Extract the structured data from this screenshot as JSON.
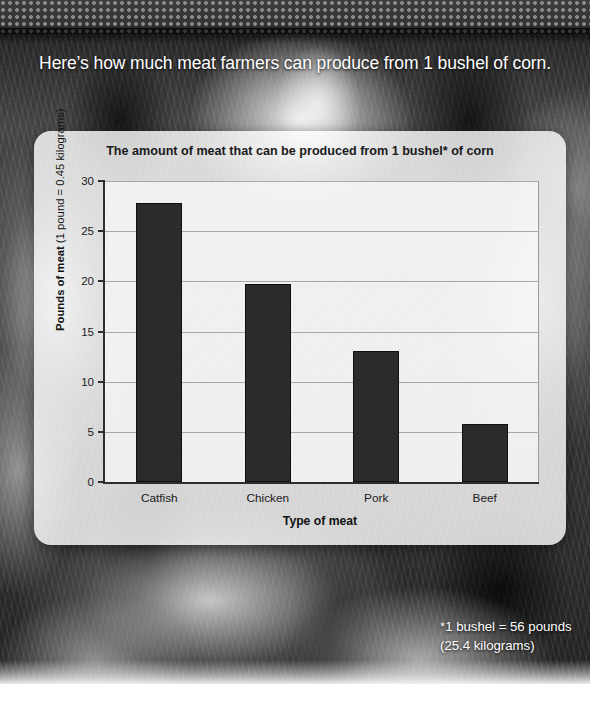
{
  "headline": "Here’s how much meat farmers can produce from 1 bushel of corn.",
  "footnote": {
    "line1": "*1 bushel = 56 pounds",
    "line2": "(25.4 kilograms)"
  },
  "axis": {
    "y_title_bold": "Pounds of meat ",
    "y_title_regular": "(1 pound = 0.45 kilograms)",
    "x_title": "Type of meat"
  },
  "colors": {
    "bar": "#2b2b2b",
    "card": "rgba(255,255,255,0.80)",
    "text": "#1a1a1a",
    "headline": "#ffffff"
  },
  "chart_data": {
    "type": "bar",
    "title": "The amount of meat that can be produced from 1 bushel* of corn",
    "categories": [
      "Catfish",
      "Chicken",
      "Pork",
      "Beef"
    ],
    "values": [
      27.8,
      19.7,
      13.1,
      5.8
    ],
    "xlabel": "Type of meat",
    "ylabel": "Pounds of meat (1 pound = 0.45 kilograms)",
    "ylim": [
      0,
      30
    ],
    "yticks": [
      0,
      5,
      10,
      15,
      20,
      25,
      30
    ],
    "ytick_labels": [
      "0",
      "5",
      "10",
      "15",
      "20",
      "25",
      "30"
    ],
    "grid": true,
    "legend": null
  }
}
